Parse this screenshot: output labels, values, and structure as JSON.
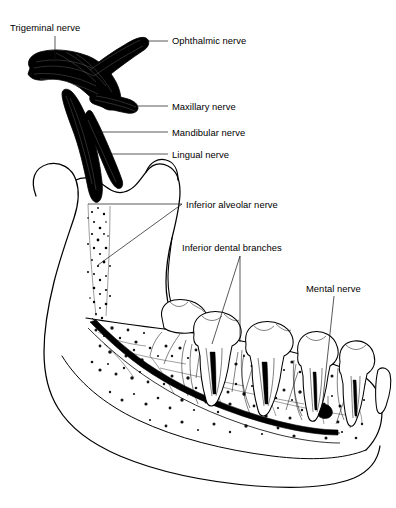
{
  "figure": {
    "background_color": "#ffffff",
    "ink_color": "#000000",
    "width": 396,
    "height": 508,
    "style": "black-and-white line drawing with stipple shading"
  },
  "labels": [
    {
      "id": "trigeminal-nerve",
      "text": "Trigeminal nerve",
      "x": 10,
      "y": 31,
      "anchor": "start",
      "leader": "M 55 36 L 55 62",
      "leader_type": "vertical"
    },
    {
      "id": "ophthalmic-nerve",
      "text": "Ophthalmic nerve",
      "x": 172,
      "y": 44,
      "anchor": "start",
      "leader": "M 168 41 L 148 41",
      "leader_type": "horizontal"
    },
    {
      "id": "maxillary-nerve",
      "text": "Maxillary nerve",
      "x": 172,
      "y": 110,
      "anchor": "start",
      "leader": "M 168 106 L 138 106",
      "leader_type": "horizontal"
    },
    {
      "id": "mandibular-nerve",
      "text": "Mandibular nerve",
      "x": 172,
      "y": 136,
      "anchor": "start",
      "leader": "M 168 132 L 96 132",
      "leader_type": "horizontal"
    },
    {
      "id": "lingual-nerve",
      "text": "Lingual nerve",
      "x": 172,
      "y": 158,
      "anchor": "start",
      "leader": "M 168 154 L 109 154",
      "leader_type": "horizontal"
    },
    {
      "id": "inferior-alveolar-nerve",
      "text": "Inferior alveolar nerve",
      "x": 186,
      "y": 208,
      "anchor": "start",
      "leader": "M 182 204 L 88 204",
      "leader_type": "horizontal"
    },
    {
      "id": "inferior-dental-branches",
      "text": "Inferior dental branches",
      "x": 182,
      "y": 251,
      "anchor": "start",
      "leader": "M 240 256 L 212 344",
      "leader_type": "diagonal"
    },
    {
      "id": "mental-nerve",
      "text": "Mental nerve",
      "x": 306,
      "y": 292,
      "anchor": "start",
      "leader": "M 334 296 L 322 408",
      "leader_type": "diagonal"
    }
  ],
  "extra_leaders": [
    {
      "id": "inferior-alveolar-nerve-diagonal",
      "path": "M 182 204 L 98 265"
    },
    {
      "id": "inferior-dental-branches-second",
      "path": "M 240 256 L 240 342"
    }
  ],
  "anatomy": {
    "structures": [
      "trigeminal ganglion",
      "ophthalmic nerve branch",
      "maxillary nerve branch",
      "mandibular nerve trunk",
      "lingual nerve",
      "inferior alveolar nerve",
      "mandibular canal",
      "inferior dental branches",
      "mental nerve",
      "mental foramen",
      "mandible ramus",
      "mandibular condyle",
      "coronoid process",
      "mandibular body",
      "cancellous bone stipple",
      "molar teeth",
      "premolar teeth",
      "incisor teeth"
    ],
    "tooth_count": 8
  }
}
